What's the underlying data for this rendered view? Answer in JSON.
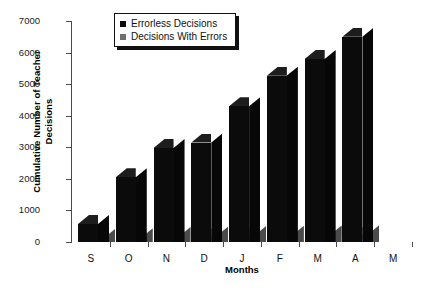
{
  "chart_data": {
    "type": "bar",
    "title": "",
    "xlabel": "Months",
    "ylabel": "Cumulative Number of Teacher Decisions",
    "categories": [
      "S",
      "O",
      "N",
      "D",
      "J",
      "F",
      "M",
      "A",
      "M"
    ],
    "ylim": [
      0,
      7000
    ],
    "ytick_values": [
      0,
      1000,
      2000,
      3000,
      4000,
      5000,
      6000,
      7000
    ],
    "ytick_labels": [
      "0",
      "1000",
      "2000",
      "3000",
      "4000",
      "5000",
      "6000",
      "7000"
    ],
    "grid": false,
    "legend_position": "top-left-inside",
    "style": "3d-bars",
    "series": [
      {
        "name": "Errorless Decisions",
        "color": "#0b0b0b",
        "values": [
          570,
          2050,
          2980,
          3150,
          4300,
          5270,
          5800,
          6500,
          null
        ]
      },
      {
        "name": "Decisions With Errors",
        "color": "#6e6e6e",
        "values": [
          130,
          150,
          190,
          210,
          220,
          230,
          240,
          250,
          null
        ]
      }
    ]
  },
  "axis": {
    "y_title_line1": "Cumulative Number of Teacher",
    "y_title_line2": "Decisions",
    "x_title": "Months"
  },
  "legend": {
    "items": [
      {
        "label": "Errorless Decisions",
        "color": "#0b0b0b"
      },
      {
        "label": "Decisions With Errors",
        "color": "#6e6e6e"
      }
    ]
  }
}
